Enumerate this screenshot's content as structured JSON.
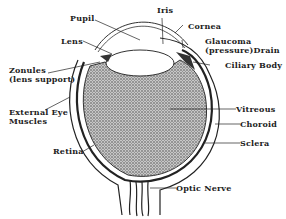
{
  "diagram": {
    "labels": {
      "pupil": "Pupil",
      "iris": "Iris",
      "cornea": "Cornea",
      "lens": "Lens",
      "glaucoma_line1": "Glaucoma",
      "glaucoma_line2": "(pressure)Drain",
      "ciliary_body": "Ciliary Body",
      "zonules_line1": "Zonules",
      "zonules_line2": "(lens support)",
      "external_line1": "External Eye",
      "external_line2": "Muscles",
      "vitreous": "Vitreous",
      "choroid": "Choroid",
      "sclera": "Sclera",
      "retina": "Retina",
      "optic_nerve": "Optic Nerve"
    },
    "colors": {
      "ink": "#222222",
      "stipple": "#9a9a9a",
      "background": "#ffffff"
    }
  }
}
